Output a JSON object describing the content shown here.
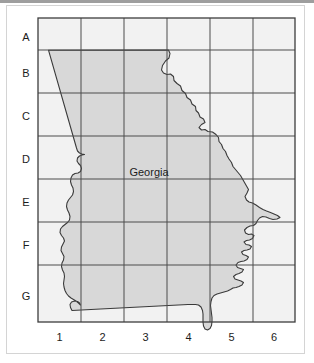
{
  "figure": {
    "kind": "grid-reference-map",
    "place_label": "Georgia",
    "row_labels": [
      "A",
      "B",
      "C",
      "D",
      "E",
      "F",
      "G"
    ],
    "column_labels": [
      "1",
      "2",
      "3",
      "4",
      "5",
      "6"
    ],
    "colors": {
      "page_background": "#ffffff",
      "frame_border": "#d4d4d4",
      "top_strip": "#9e9e9e",
      "outside_fill": "#f2f2f2",
      "state_fill": "#d8d8d8",
      "grid_line": "#4d4d4d",
      "grid_border": "#3d3d3d",
      "state_outline": "#3a3a3a",
      "label_text": "#1c1c1c"
    },
    "grid": {
      "columns": 6,
      "rows": 7,
      "left": 38,
      "top": 18,
      "right": 295,
      "bottom": 322,
      "column_edges": [
        38,
        81,
        124,
        167,
        210,
        253,
        295
      ],
      "row_edges": [
        18,
        50,
        93,
        136,
        179,
        222,
        265,
        322
      ]
    }
  }
}
